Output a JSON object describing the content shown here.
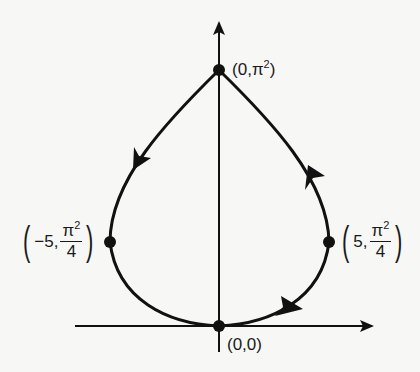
{
  "diagram": {
    "type": "closed-curve-phase-path",
    "stroke_color": "#111111",
    "background_color": "#f7f7f5",
    "axes": {
      "origin_px": [
        219,
        326
      ],
      "x_axis": {
        "from_px": 75,
        "to_px": 373,
        "arrow": "right"
      },
      "y_axis": {
        "from_px": 352,
        "to_px": 22,
        "arrow": "up"
      }
    },
    "points": [
      {
        "id": "top",
        "x": "0",
        "y": "π²",
        "label": "(0,π²)"
      },
      {
        "id": "left",
        "x": "-5",
        "y": "π²/4",
        "label": "(-5, π²/4)"
      },
      {
        "id": "right",
        "x": "5",
        "y": "π²/4",
        "label": "(5, π²/4)"
      },
      {
        "id": "origin",
        "x": "0",
        "y": "0",
        "label": "(0,0)"
      }
    ],
    "direction": "counterclockwise: origin → right → top → left → origin",
    "arrows": [
      {
        "segment": "origin-to-right",
        "direction": "up-right"
      },
      {
        "segment": "right-to-top",
        "direction": "up"
      },
      {
        "segment": "top-to-left",
        "direction": "down-left"
      }
    ]
  },
  "labels": {
    "top": {
      "open": "(",
      "x": "0",
      "sep": ",",
      "y_base": "π",
      "y_exp": "2",
      "close": ")"
    },
    "left": {
      "open": "(",
      "x": "−5",
      "sep": ",",
      "num_base": "π",
      "num_exp": "2",
      "den": "4",
      "close": ")"
    },
    "right": {
      "open": "(",
      "x": "5",
      "sep": ",",
      "num_base": "π",
      "num_exp": "2",
      "den": "4",
      "close": ")"
    },
    "origin": {
      "text": "(0,0)"
    }
  }
}
